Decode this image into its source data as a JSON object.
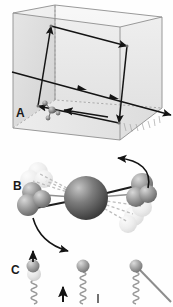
{
  "figure": {
    "type": "scientific-schematic",
    "panel_count": 3,
    "background_color": "#ffffff",
    "ink_color": "#1a1a1a",
    "panels": [
      {
        "id": "A",
        "label": "A",
        "caption": "",
        "description": "Transparent three-dimensional box in oblique projection containing a closed parallelogram beam path traced by arrows, a straight beam entering the box and exiting to the lower right, and a small molecular cluster on the left face targeted by an arrow.",
        "shading": {
          "left_face": "#dedede",
          "back_face": "#ebebeb",
          "bottom_face": "#e4e4e4",
          "edge_color": "#8c8c8c"
        },
        "elements": [
          {
            "name": "box",
            "kind": "wireframe-cuboid"
          },
          {
            "name": "beam-path",
            "kind": "closed-parallelogram",
            "arrow_count": 4
          },
          {
            "name": "through-beam",
            "kind": "straight-line",
            "arrow_count": 2
          },
          {
            "name": "molecule",
            "kind": "ball-and-stick-cluster",
            "atom_count": 4
          },
          {
            "name": "pointer-arrow",
            "kind": "arrow",
            "direction": "left"
          },
          {
            "name": "hidden-edges",
            "kind": "dashed-lines"
          }
        ]
      },
      {
        "id": "B",
        "label": "B",
        "caption": "",
        "description": "Ball-and-stick molecular model with one large central dark sphere bonded to two outer sphere groups; semi-transparent ghost copies and dashed bonds indicate vibrational or rotational displacement, with curved motion arrows at the upper right and lower left.",
        "shading": {
          "central_sphere": "#5a5a5a",
          "outer_sphere": "#9a9a9a",
          "ghost_sphere": "#e8e8e8",
          "bond_color": "#222222",
          "dashed_bond_color": "#b5b5b5"
        },
        "elements": [
          {
            "name": "central-atom",
            "kind": "sphere",
            "size": "large"
          },
          {
            "name": "left-atom-group",
            "kind": "sphere-cluster",
            "count": 3
          },
          {
            "name": "right-atom-group",
            "kind": "sphere-cluster",
            "count": 3
          },
          {
            "name": "ghost-atoms",
            "kind": "motion-blur-copies"
          },
          {
            "name": "motion-arrow-up",
            "kind": "curved-arrow",
            "direction": "up-left"
          },
          {
            "name": "motion-arrow-down",
            "kind": "curved-arrow",
            "direction": "down-right"
          }
        ]
      },
      {
        "id": "C",
        "label": "C",
        "caption": "",
        "description": "Three sphere-on-spring oscillator figures, partially cropped at the lower edge. The left oscillator shows a displaced blurred sphere with an upward arrow; the middle one is at rest with an upward arrow beside it; the right one is tilted with a diagonal connecting rod.",
        "shading": {
          "sphere": "#a8a8a8",
          "ghost_sphere": "#dcdcdc",
          "spring_color": "#999999",
          "arrow_color": "#1a1a1a"
        },
        "elements": [
          {
            "name": "oscillator-left",
            "kind": "sphere-on-spring",
            "state": "displaced"
          },
          {
            "name": "oscillator-middle",
            "kind": "sphere-on-spring",
            "state": "rest"
          },
          {
            "name": "oscillator-right",
            "kind": "sphere-on-spring",
            "state": "tilted"
          },
          {
            "name": "arrow-left",
            "kind": "straight-arrow",
            "direction": "up"
          },
          {
            "name": "arrow-middle",
            "kind": "straight-arrow",
            "direction": "up"
          },
          {
            "name": "tick-middle",
            "kind": "short-mark"
          }
        ]
      }
    ]
  }
}
